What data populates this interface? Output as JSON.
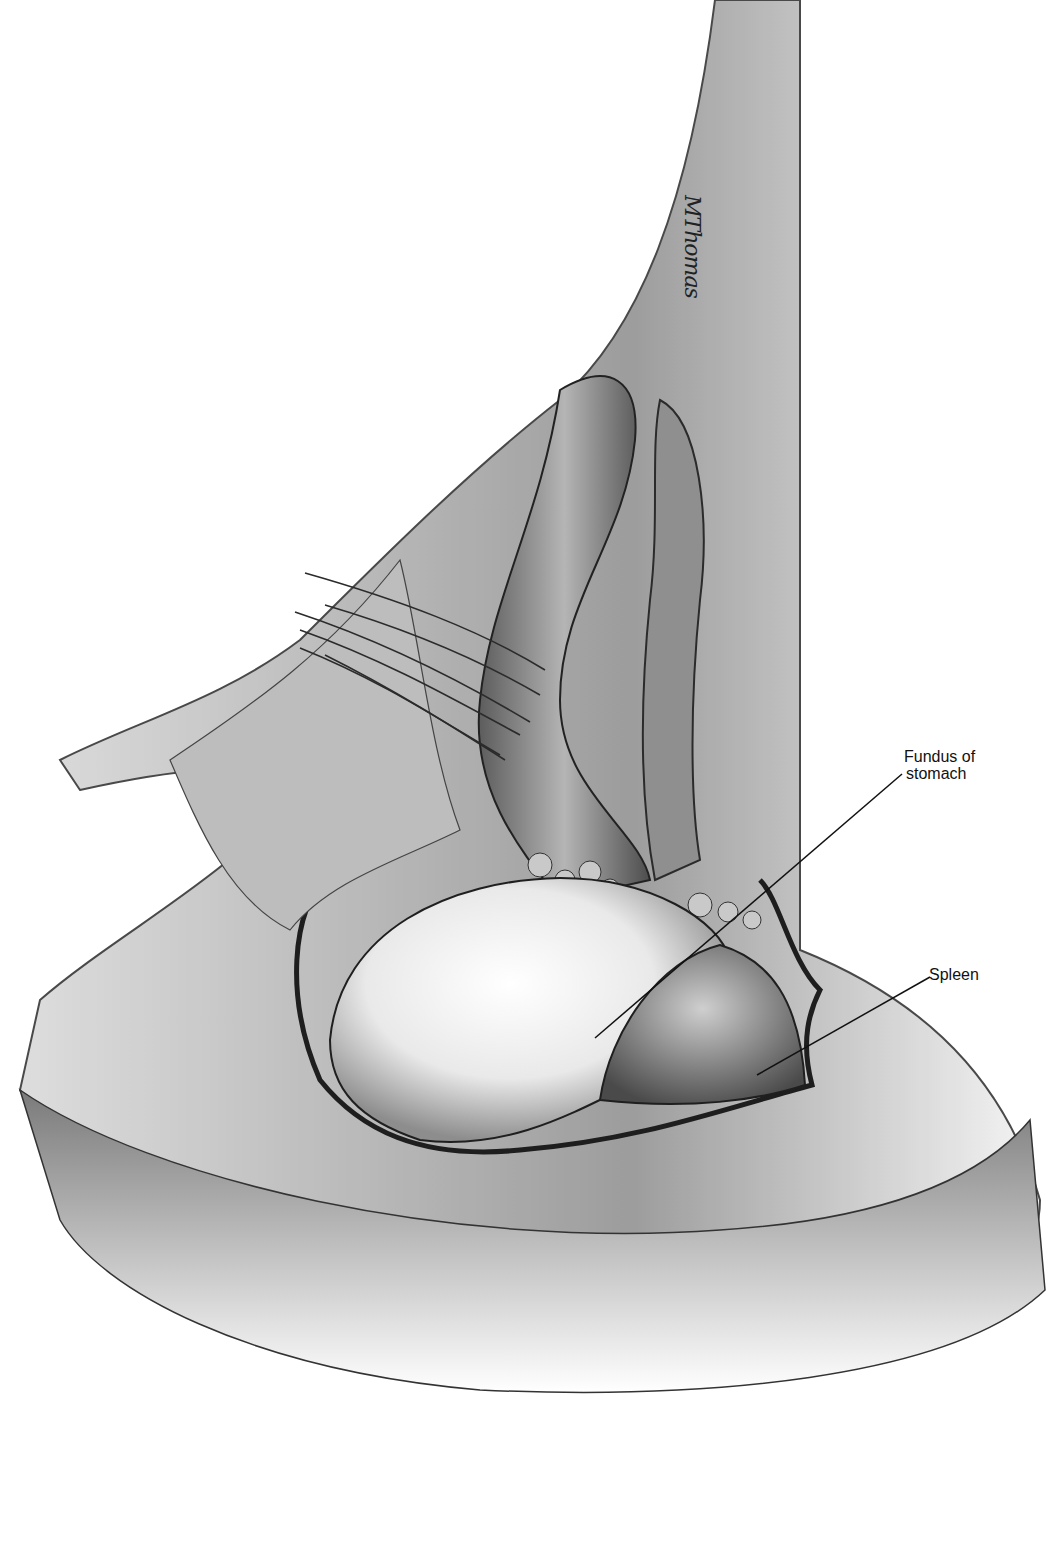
{
  "figure": {
    "type": "surgical anatomical illustration",
    "style": "grayscale",
    "signature": "MThomas"
  },
  "labels": [
    {
      "id": "fundus",
      "text_line1": "Fundus of",
      "text_line2": "stomach",
      "leader": {
        "x1": 595,
        "y1": 1038,
        "x2": 902,
        "y2": 774
      }
    },
    {
      "id": "spleen",
      "text": "Spleen",
      "leader": {
        "x1": 757,
        "y1": 1075,
        "x2": 930,
        "y2": 977
      }
    }
  ],
  "colors": {
    "background": "#ffffff",
    "ink": "#111111",
    "tissue_mid": "#9a9a9a",
    "tissue_dark": "#3c3c3c"
  }
}
